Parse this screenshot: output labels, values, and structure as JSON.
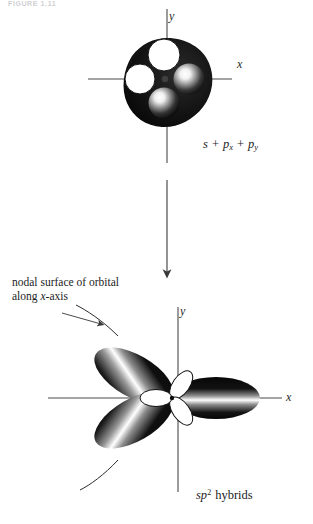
{
  "figure": {
    "header_fragment": "FIGURE 1.11",
    "top_panel": {
      "axis_x_label": "x",
      "axis_y_label": "y",
      "caption_parts": {
        "s": "s",
        "plus1": "+",
        "p": "p",
        "sub_x": "x",
        "plus2": "+",
        "p2": "p",
        "sub_y": "y"
      },
      "caption_plain": "s + px + py",
      "orbital_lobes": [
        {
          "name": "white-lobe-upper",
          "fill": "#ffffff",
          "stroke": "#111111"
        },
        {
          "name": "white-lobe-left",
          "fill": "#ffffff",
          "stroke": "#111111"
        },
        {
          "name": "shaded-sphere-right",
          "fill": "#151515",
          "highlight": "#ffffff"
        },
        {
          "name": "shaded-sphere-lower",
          "fill": "#151515",
          "highlight": "#ffffff"
        },
        {
          "name": "dark-envelope",
          "fill": "#101010"
        },
        {
          "name": "nucleus-dot",
          "fill": "#3a3a3a"
        }
      ]
    },
    "transition": {
      "arrow_name": "downward-transformation-arrow",
      "direction": "down"
    },
    "bottom_panel": {
      "axis_x_label": "x",
      "axis_y_label": "y",
      "caption_parts": {
        "sp": "sp",
        "exponent": "2",
        "word": "hybrids"
      },
      "caption_plain": "sp2 hybrids",
      "annotation_line_1": "nodal surface of orbital",
      "annotation_line_2_pre": "along ",
      "annotation_line_2_italic": "x",
      "annotation_line_2_post": "-axis",
      "annotation_plain": "nodal surface of orbital along x-axis",
      "hybrid_lobes": [
        {
          "name": "hybrid-lobe-upper-left",
          "angle_deg": 150,
          "fill": "#0d0d0d",
          "highlight": "#ffffff"
        },
        {
          "name": "hybrid-lobe-lower-left",
          "angle_deg": 210,
          "fill": "#0d0d0d",
          "highlight": "#ffffff"
        },
        {
          "name": "hybrid-lobe-right",
          "angle_deg": 0,
          "fill": "#0d0d0d",
          "highlight": "#ffffff"
        }
      ],
      "back_lobes": [
        {
          "name": "back-lobe-upper-right",
          "fill": "#ffffff",
          "stroke": "#111111"
        },
        {
          "name": "back-lobe-lower-right",
          "fill": "#ffffff",
          "stroke": "#111111"
        },
        {
          "name": "back-lobe-left",
          "fill": "#ffffff",
          "stroke": "#111111"
        }
      ],
      "nodal_curves": [
        {
          "name": "nodal-curve-upper",
          "stroke": "#2a2a2a"
        },
        {
          "name": "nodal-curve-lower",
          "stroke": "#2a2a2a"
        }
      ]
    },
    "colors": {
      "axis": "#4a4a4a",
      "lobe_dark": "#0d0d0d",
      "lobe_light": "#ffffff",
      "text": "#1c1c1c",
      "background": "#ffffff"
    }
  }
}
